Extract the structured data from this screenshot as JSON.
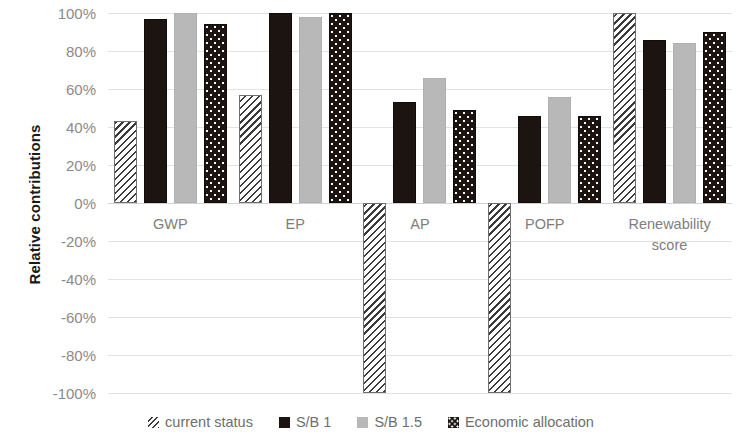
{
  "chart_data": {
    "type": "bar",
    "title": "",
    "xlabel": "",
    "ylabel": "Relative contributions",
    "ylim": [
      -100,
      100
    ],
    "ytick_step": 20,
    "ytick_labels": [
      "100%",
      "80%",
      "60%",
      "40%",
      "20%",
      "0%",
      "-20%",
      "-40%",
      "-60%",
      "-80%",
      "-100%"
    ],
    "ytick_values": [
      100,
      80,
      60,
      40,
      20,
      0,
      -20,
      -40,
      -60,
      -80,
      -100
    ],
    "grid": true,
    "legend_position": "bottom",
    "categories": [
      "GWP",
      "EP",
      "AP",
      "POFP",
      "Renewability score"
    ],
    "category_lines": [
      [
        "GWP"
      ],
      [
        "EP"
      ],
      [
        "AP"
      ],
      [
        "POFP"
      ],
      [
        "Renewability",
        "score"
      ]
    ],
    "series": [
      {
        "name": "current status",
        "pattern": "hatch",
        "color": "#3a3a3a",
        "values": [
          43,
          57,
          -100,
          -100,
          100
        ]
      },
      {
        "name": "S/B 1",
        "pattern": "solid",
        "color": "#1c1411",
        "values": [
          97,
          100,
          53,
          46,
          86
        ]
      },
      {
        "name": "S/B 1.5",
        "pattern": "solid",
        "color": "#b8b8b8",
        "values": [
          100,
          98,
          66,
          56,
          84
        ]
      },
      {
        "name": "Economic allocation",
        "pattern": "dots",
        "color": "#1c1411",
        "values": [
          94,
          100,
          49,
          46,
          90
        ]
      }
    ]
  }
}
